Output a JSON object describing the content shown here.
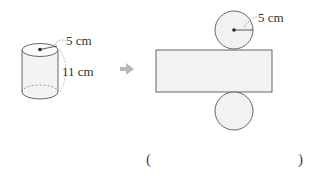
{
  "cylinder": {
    "radius_label": "5 cm",
    "height_label": "11 cm"
  },
  "net": {
    "radius_label": "5 cm"
  },
  "answer": {
    "open": "(",
    "close": ")",
    "value": ""
  },
  "colors": {
    "stroke": "#555555",
    "fill": "#f2f2f2",
    "arrow": "#b8b8b8"
  }
}
